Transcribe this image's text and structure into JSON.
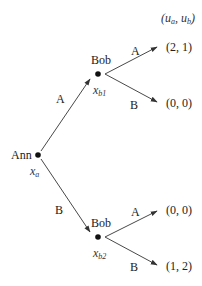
{
  "diagram": {
    "type": "extensive-form game tree",
    "header": {
      "u": "u",
      "a": "a",
      "b": "b",
      "open": "(",
      "comma": ", ",
      "close": ")"
    },
    "nodes": {
      "root": {
        "player": "Ann",
        "var": "x",
        "sub": "a"
      },
      "bob_top": {
        "player": "Bob",
        "var": "x",
        "sub": "b1"
      },
      "bob_bottom": {
        "player": "Bob",
        "var": "x",
        "sub": "b2"
      }
    },
    "edges": {
      "root_A": "A",
      "root_B": "B",
      "top_A": "A",
      "top_B": "B",
      "bottom_A": "A",
      "bottom_B": "B"
    },
    "payoffs": {
      "top_A": "(2, 1)",
      "top_B": "(0, 0)",
      "bottom_A": "(0, 0)",
      "bottom_B": "(1, 2)"
    }
  }
}
